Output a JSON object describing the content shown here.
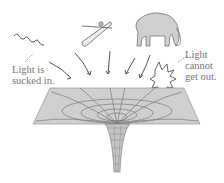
{
  "figure": {
    "labels": {
      "left_line1": "Light is",
      "left_line2": "sucked in.",
      "right_line1": "Light",
      "right_line2": "cannot",
      "right_line3": "get out."
    },
    "objects": [
      "wavy-light-ray",
      "kayak-with-paddler",
      "elephant",
      "escaping-light-ray"
    ],
    "colors": {
      "surface": "#cfcfcf",
      "grid": "#7a7a7a",
      "text": "#777777",
      "ink": "#555555"
    }
  }
}
